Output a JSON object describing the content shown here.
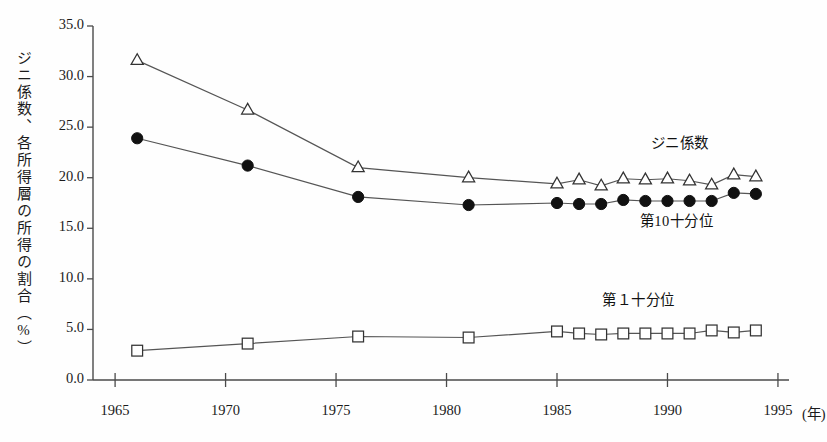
{
  "chart_data": {
    "type": "line",
    "title": "",
    "subtitle": "",
    "xlabel": "",
    "xunit": "(年)",
    "ylabel": "ジニ係数、各所得層の所得の割合（%）",
    "xlim": [
      1964.0,
      1995.5
    ],
    "ylim": [
      0.0,
      35.0
    ],
    "grid": false,
    "legend_position": "inline-annotations",
    "x_ticks": [
      1965,
      1970,
      1975,
      1980,
      1985,
      1990,
      1995
    ],
    "x_tick_labels": [
      "1965",
      "1970",
      "1975",
      "1980",
      "1985",
      "1990",
      "1995"
    ],
    "y_ticks": [
      0.0,
      5.0,
      10.0,
      15.0,
      20.0,
      25.0,
      30.0,
      35.0
    ],
    "y_tick_labels": [
      "0.0",
      "5.0",
      "10.0",
      "15.0",
      "20.0",
      "25.0",
      "30.0",
      "35.0"
    ],
    "series": [
      {
        "name": "ジニ係数",
        "marker": "triangle-open",
        "label_x": 1990.6,
        "label_y": 23.6,
        "points": [
          {
            "x": 1966,
            "y": 31.6
          },
          {
            "x": 1971,
            "y": 26.7
          },
          {
            "x": 1976,
            "y": 21.0
          },
          {
            "x": 1981,
            "y": 20.0
          },
          {
            "x": 1985,
            "y": 19.4
          },
          {
            "x": 1986,
            "y": 19.8
          },
          {
            "x": 1987,
            "y": 19.2
          },
          {
            "x": 1988,
            "y": 19.9
          },
          {
            "x": 1989,
            "y": 19.8
          },
          {
            "x": 1990,
            "y": 19.9
          },
          {
            "x": 1991,
            "y": 19.7
          },
          {
            "x": 1992,
            "y": 19.3
          },
          {
            "x": 1993,
            "y": 20.3
          },
          {
            "x": 1994,
            "y": 20.1
          }
        ]
      },
      {
        "name": "第10十分位",
        "marker": "circle-filled",
        "label_x": 1990.1,
        "label_y": 15.9,
        "points": [
          {
            "x": 1966,
            "y": 23.9
          },
          {
            "x": 1971,
            "y": 21.2
          },
          {
            "x": 1976,
            "y": 18.1
          },
          {
            "x": 1981,
            "y": 17.3
          },
          {
            "x": 1985,
            "y": 17.5
          },
          {
            "x": 1986,
            "y": 17.4
          },
          {
            "x": 1987,
            "y": 17.4
          },
          {
            "x": 1988,
            "y": 17.8
          },
          {
            "x": 1989,
            "y": 17.7
          },
          {
            "x": 1990,
            "y": 17.7
          },
          {
            "x": 1991,
            "y": 17.7
          },
          {
            "x": 1992,
            "y": 17.7
          },
          {
            "x": 1993,
            "y": 18.5
          },
          {
            "x": 1994,
            "y": 18.4
          }
        ]
      },
      {
        "name": "第１十分位",
        "marker": "square-open",
        "label_x": 1988.4,
        "label_y": 8.1,
        "points": [
          {
            "x": 1966,
            "y": 2.9
          },
          {
            "x": 1971,
            "y": 3.6
          },
          {
            "x": 1976,
            "y": 4.3
          },
          {
            "x": 1981,
            "y": 4.2
          },
          {
            "x": 1985,
            "y": 4.8
          },
          {
            "x": 1986,
            "y": 4.6
          },
          {
            "x": 1987,
            "y": 4.5
          },
          {
            "x": 1988,
            "y": 4.6
          },
          {
            "x": 1989,
            "y": 4.6
          },
          {
            "x": 1990,
            "y": 4.6
          },
          {
            "x": 1991,
            "y": 4.6
          },
          {
            "x": 1992,
            "y": 4.9
          },
          {
            "x": 1993,
            "y": 4.7
          },
          {
            "x": 1994,
            "y": 4.9
          }
        ]
      }
    ],
    "colors": {
      "axis": "#4a4a4a",
      "line": "#555555",
      "marker_fill_open": "#ffffff",
      "marker_fill_solid": "#111111",
      "marker_stroke": "#333333",
      "text": "#1b1b1b",
      "background": "#fefefe"
    }
  }
}
